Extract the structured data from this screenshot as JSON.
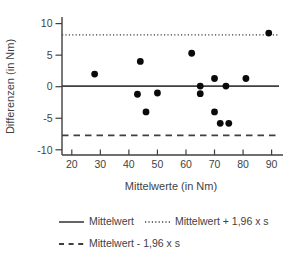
{
  "figure": {
    "background": "#ffffff",
    "text_color": "#3f3f3f",
    "axis_color": "#3f3f3f",
    "point_color": "#0a0a0a"
  },
  "chart_data": {
    "type": "scatter",
    "title": "",
    "xlabel": "Mittelwerte (in Nm)",
    "ylabel": "Differenzen (in Nm)",
    "x_ticks": [
      20,
      30,
      40,
      50,
      60,
      70,
      80,
      90
    ],
    "y_ticks": [
      10,
      5,
      0,
      -5,
      -10
    ],
    "xlim": [
      16.6,
      94
    ],
    "ylim": [
      -10.8,
      11
    ],
    "grid": false,
    "legend_position": "bottom",
    "points": [
      {
        "x": 28,
        "y": 2
      },
      {
        "x": 43,
        "y": -1.2
      },
      {
        "x": 44,
        "y": 4
      },
      {
        "x": 46,
        "y": -4
      },
      {
        "x": 50,
        "y": -1
      },
      {
        "x": 62,
        "y": 5.3
      },
      {
        "x": 65,
        "y": 0.1
      },
      {
        "x": 65,
        "y": -1.1
      },
      {
        "x": 70,
        "y": 1.3
      },
      {
        "x": 70,
        "y": -4
      },
      {
        "x": 72,
        "y": -5.8
      },
      {
        "x": 74,
        "y": 0.1
      },
      {
        "x": 75,
        "y": -5.8
      },
      {
        "x": 81,
        "y": 1.3
      },
      {
        "x": 89,
        "y": 8.5
      }
    ],
    "reference_lines": [
      {
        "name": "mean",
        "value": 0.1,
        "style": "solid",
        "label": "Mittelwert"
      },
      {
        "name": "upper-limit",
        "value": 8.2,
        "style": "dotted",
        "label": "Mittelwert + 1,96 x s"
      },
      {
        "name": "lower-limit",
        "value": -7.7,
        "style": "dashed",
        "label": "Mittelwert - 1,96 x s"
      }
    ]
  }
}
